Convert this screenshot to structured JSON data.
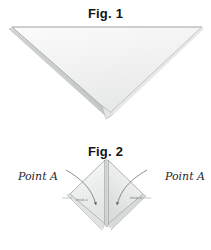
{
  "page": {
    "background_color": "#ffffff"
  },
  "figures": [
    {
      "id": "fig-1",
      "caption": "Fig. 1",
      "shape_name": "folded-triangle",
      "description": "Inverted triangle of folded cloth with layered edge on the left side",
      "fill_color": "#f2f3f2",
      "edge_color": "#9aa0a0",
      "shadow_color": "#c9cccb"
    },
    {
      "id": "fig-2",
      "caption": "Fig. 2",
      "shape_name": "folded-diamond",
      "description": "Diamond of folded cloth split at the bottom with curved arrows folding Point A inward from each side",
      "fill_color": "#eef0ef",
      "edge_color": "#8e9494",
      "shadow_color": "#c4c8c7",
      "arrow_color": "#6f7574"
    }
  ],
  "annotations": {
    "point_a_left": "Point A",
    "point_a_right": "Point A",
    "point_a_inner_left": "Point A",
    "point_a_inner_right": "Point A"
  },
  "colors": {
    "background": "#ffffff",
    "caption_text": "#131313",
    "label_text": "#2a2a2a",
    "cloth_fill": "#f2f3f2",
    "cloth_edge": "#9aa0a0"
  }
}
